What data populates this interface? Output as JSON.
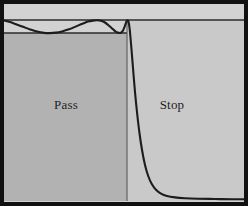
{
  "figure": {
    "kind": "filter-response-diagram",
    "width": 248,
    "height": 206,
    "border_color": "#111111",
    "background_color": "#d2d2d2"
  },
  "labels": {
    "pass": "Pass",
    "stop": "Stop"
  },
  "regions": {
    "pass": {
      "name": "Pass",
      "fill": "#b2b2b2",
      "x0": 4,
      "x1": 127,
      "y0": 33,
      "y1": 201
    },
    "stop": {
      "name": "Stop",
      "fill": "#c9c9c9",
      "x0": 127,
      "x1": 244,
      "y0": 20,
      "y1": 201
    }
  },
  "lines": {
    "upper_ripple_bound": {
      "y": 20,
      "x0": 4,
      "x1": 244,
      "color": "#2b2b2b"
    },
    "lower_ripple_bound": {
      "y": 33,
      "x0": 4,
      "x1": 127,
      "color": "#2b2b2b"
    },
    "band_edge": {
      "x": 127,
      "y0": 20,
      "y1": 201,
      "color": "#4a4a4a"
    }
  },
  "chart_data": {
    "type": "line",
    "title": "",
    "xlabel": "",
    "ylabel": "",
    "xlim": [
      4,
      244
    ],
    "ylim": [
      201,
      20
    ],
    "grid": false,
    "legend": "none",
    "annotations": [
      {
        "text": "Pass",
        "x": 66,
        "y": 104
      },
      {
        "text": "Stop",
        "x": 172,
        "y": 104
      }
    ],
    "reference_lines": [
      {
        "name": "upper-ripple-bound",
        "orientation": "horizontal",
        "value": 20
      },
      {
        "name": "lower-ripple-bound",
        "orientation": "horizontal",
        "value": 33
      },
      {
        "name": "band-edge",
        "orientation": "vertical",
        "value": 127
      }
    ],
    "series": [
      {
        "name": "magnitude-response",
        "color": "#1c1c1c",
        "width": 2.1,
        "points": [
          [
            4,
            20.5
          ],
          [
            10,
            22.0
          ],
          [
            16,
            24.2
          ],
          [
            23,
            26.8
          ],
          [
            30,
            29.4
          ],
          [
            37,
            31.6
          ],
          [
            44,
            32.9
          ],
          [
            50,
            33.1
          ],
          [
            56,
            32.6
          ],
          [
            62,
            31.4
          ],
          [
            69,
            29.3
          ],
          [
            76,
            26.4
          ],
          [
            83,
            23.5
          ],
          [
            88,
            21.6
          ],
          [
            93,
            20.6
          ],
          [
            97,
            20.3
          ],
          [
            101,
            20.8
          ],
          [
            105,
            22.5
          ],
          [
            109,
            25.7
          ],
          [
            113,
            29.3
          ],
          [
            116,
            31.8
          ],
          [
            119,
            32.9
          ],
          [
            121,
            32.6
          ],
          [
            123,
            30.4
          ],
          [
            125,
            25.6
          ],
          [
            126.5,
            21.4
          ],
          [
            127.4,
            20.2
          ],
          [
            128.6,
            22.0
          ],
          [
            129.8,
            30.0
          ],
          [
            131.2,
            46.0
          ],
          [
            133.0,
            68.0
          ],
          [
            135.0,
            92.0
          ],
          [
            137.2,
            114.0
          ],
          [
            139.6,
            134.0
          ],
          [
            142.2,
            151.0
          ],
          [
            145.0,
            165.0
          ],
          [
            148.2,
            176.0
          ],
          [
            151.8,
            184.0
          ],
          [
            156.0,
            189.8
          ],
          [
            161.0,
            193.6
          ],
          [
            167.0,
            196.0
          ],
          [
            175.0,
            197.4
          ],
          [
            185.0,
            198.2
          ],
          [
            198.0,
            198.7
          ],
          [
            215.0,
            199.0
          ],
          [
            232.0,
            199.2
          ],
          [
            244.0,
            199.3
          ]
        ]
      }
    ]
  }
}
